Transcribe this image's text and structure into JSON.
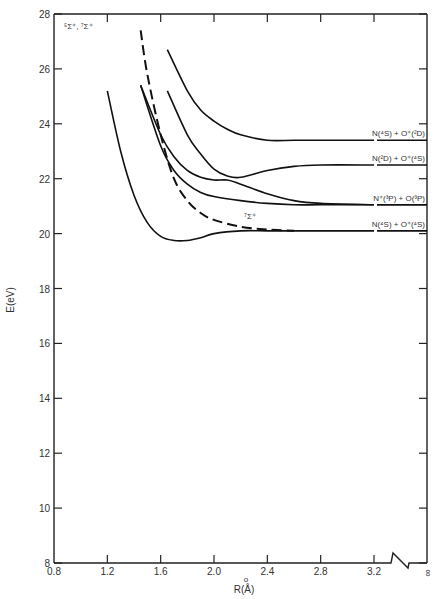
{
  "chart_data": {
    "type": "line",
    "title": "",
    "xlabel": "R(Å)",
    "ylabel": "E(eV)",
    "xlim": [
      0.8,
      3.2
    ],
    "x_break_to": "∞",
    "ylim": [
      8,
      28
    ],
    "grid": false,
    "x_ticks": [
      "0.8",
      "1.2",
      "1.6",
      "2.0",
      "2.4",
      "2.8",
      "3.2",
      "∞"
    ],
    "y_ticks": [
      "8",
      "10",
      "12",
      "14",
      "16",
      "18",
      "20",
      "22",
      "24",
      "26",
      "28"
    ],
    "annotation_top_left": "⁵Σ⁺, ⁷Σ⁺",
    "annotation_dashed": "⁷Σ⁺",
    "series": [
      {
        "name": "N(4S) + O+(2D)",
        "style": "solid",
        "x": [
          1.65,
          1.8,
          1.9,
          2.0,
          2.1,
          2.2,
          2.4,
          2.6,
          2.8,
          3.2
        ],
        "y": [
          26.7,
          25.2,
          24.5,
          24.1,
          23.8,
          23.6,
          23.4,
          23.4,
          23.4,
          23.4
        ]
      },
      {
        "name": "N(2D) + O+(4S)",
        "style": "solid",
        "x": [
          1.65,
          1.8,
          1.9,
          2.0,
          2.1,
          2.2,
          2.4,
          2.6,
          2.8,
          3.2
        ],
        "y": [
          25.2,
          23.6,
          22.9,
          22.35,
          22.1,
          22.05,
          22.3,
          22.45,
          22.5,
          22.5
        ]
      },
      {
        "name": "N+(3P) + O(3P)",
        "style": "solid",
        "x": [
          1.45,
          1.6,
          1.7,
          1.8,
          1.9,
          2.0,
          2.1,
          2.2,
          2.4,
          2.6,
          2.8,
          3.2
        ],
        "y": [
          25.4,
          23.6,
          22.8,
          22.3,
          22.05,
          21.95,
          21.95,
          21.8,
          21.45,
          21.2,
          21.1,
          21.05
        ]
      },
      {
        "name": "N+(3P) + O(3P) (lower)",
        "style": "solid",
        "x": [
          1.45,
          1.6,
          1.7,
          1.8,
          1.9,
          2.0,
          2.2,
          2.4,
          2.6,
          2.8,
          3.2
        ],
        "y": [
          25.4,
          23.2,
          22.3,
          21.8,
          21.5,
          21.35,
          21.2,
          21.1,
          21.05,
          21.05,
          21.05
        ]
      },
      {
        "name": "N(4S) + O+(4S)",
        "style": "solid",
        "x": [
          1.2,
          1.3,
          1.4,
          1.5,
          1.6,
          1.7,
          1.8,
          1.9,
          2.0,
          2.2,
          2.4,
          2.6,
          2.8,
          3.2
        ],
        "y": [
          25.2,
          23.0,
          21.4,
          20.4,
          19.9,
          19.75,
          19.75,
          19.85,
          20.0,
          20.1,
          20.1,
          20.1,
          20.1,
          20.1
        ]
      },
      {
        "name": "7Σ+",
        "style": "dashed",
        "x": [
          1.45,
          1.5,
          1.6,
          1.7,
          1.8,
          1.9,
          2.0,
          2.2,
          2.4,
          2.6
        ],
        "y": [
          27.4,
          25.8,
          23.6,
          22.0,
          21.2,
          20.75,
          20.5,
          20.25,
          20.15,
          20.1
        ]
      }
    ],
    "asymptote_labels": [
      {
        "text": "N(⁴S) + O⁺(²D)",
        "y": 23.4
      },
      {
        "text": "N(²D) + O⁺(⁴S)",
        "y": 22.5
      },
      {
        "text": "N⁺(³P) + O(³P)",
        "y": 21.05
      },
      {
        "text": "N(⁴S) + O⁺(⁴S)",
        "y": 20.1
      }
    ]
  }
}
